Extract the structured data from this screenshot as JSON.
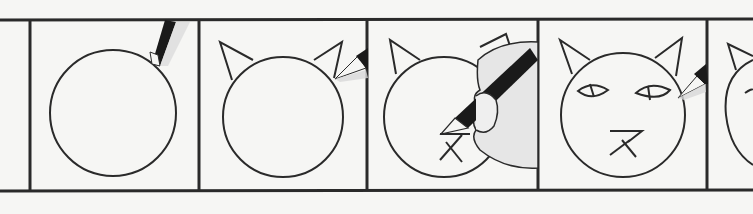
{
  "illustration": {
    "title": "Step-by-step cat face drawing strip",
    "panel_count": 5,
    "colors": {
      "paper": "#f6f6f4",
      "ink": "#2a2a2a",
      "pencil_lead": "#1a1a1a",
      "pencil_shade": "#cfcfcf",
      "skin": "#e8e8e8"
    },
    "panels": [
      {
        "step": 1,
        "description": "circle head",
        "tool": "pencil"
      },
      {
        "step": 2,
        "description": "circle with two ears",
        "tool": "pencil"
      },
      {
        "step": 3,
        "description": "head with ears, nose and mouth drawn by hand holding pencil",
        "tool": "hand-with-pencil"
      },
      {
        "step": 4,
        "description": "full cat face with eyes, nose and mouth",
        "tool": "pencil"
      },
      {
        "step": 5,
        "description": "partially visible next panel",
        "tool": "none"
      }
    ]
  }
}
